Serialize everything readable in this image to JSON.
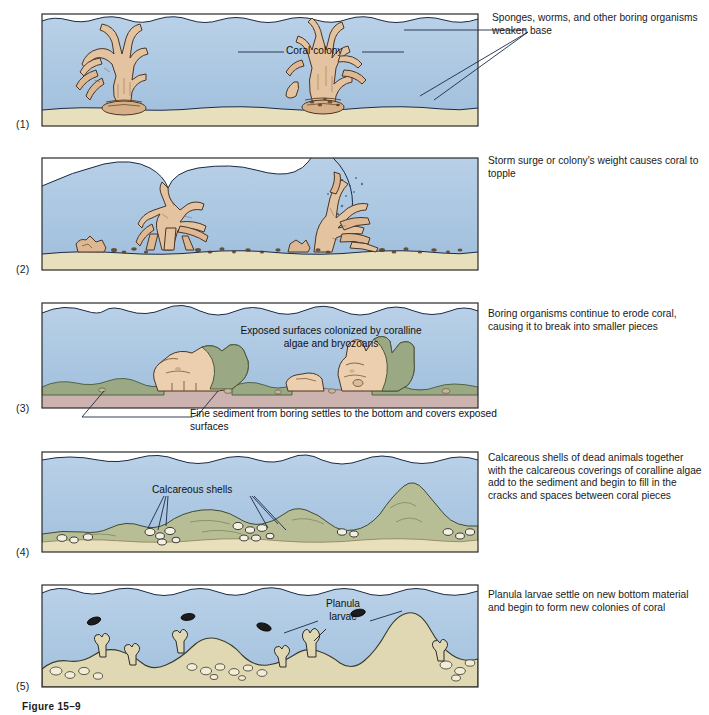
{
  "figure": {
    "caption": "Figure 15–9"
  },
  "palette": {
    "water": "#a9c6e3",
    "water_light": "#bcd4ea",
    "sand": "#e8e0bd",
    "sand_dark": "#d9cfa3",
    "coral": "#e3c3a0",
    "coral_shadow": "#c9a77f",
    "algae_green": "#9aa884",
    "algae_green_dark": "#7e8d6a",
    "outline": "#1b2a44",
    "foam": "#ffffff",
    "text": "#1a1a1a",
    "sediment_pink": "#cdb3b0"
  },
  "panels": [
    {
      "number": "(1)",
      "side_caption": "Sponges, worms, and other boring organisms weaken base",
      "labels": [
        {
          "name": "coral-colony",
          "text": "Coral colony"
        }
      ]
    },
    {
      "number": "(2)",
      "side_caption": "Storm surge or colony's weight causes coral to topple",
      "labels": []
    },
    {
      "number": "(3)",
      "side_caption": "Boring organisms continue to erode coral, causing it to break into smaller pieces",
      "labels": [
        {
          "name": "exposed-surfaces",
          "text": "Exposed surfaces colonized by coralline algae and bryozoans"
        },
        {
          "name": "fine-sediment",
          "text": "Fine sediment from boring settles to the bottom and covers exposed surfaces"
        }
      ]
    },
    {
      "number": "(4)",
      "side_caption": "Calcareous shells of dead animals together with the calcareous coverings of coralline algae add to the sediment and begin to fill in the cracks and spaces between coral pieces",
      "labels": [
        {
          "name": "calcareous-shells",
          "text": "Calcareous shells"
        }
      ]
    },
    {
      "number": "(5)",
      "side_caption": "Planula larvae settle on new bottom material and begin to form new colonies of coral",
      "labels": [
        {
          "name": "planula-larvae",
          "text_line1": "Planula",
          "text_line2": "larvae"
        }
      ]
    }
  ]
}
